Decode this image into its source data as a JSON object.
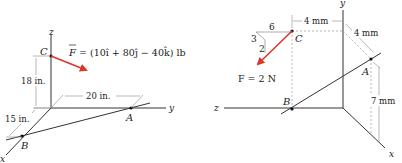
{
  "left_figure": {
    "axes": {
      "x": "x",
      "y": "y",
      "z": "z"
    },
    "points": {
      "A": "A",
      "B": "B",
      "C": "C"
    },
    "force_label_F": "F",
    "force_expression": "= (10î + 80ĵ − 40k̂) lb",
    "dimensions": {
      "height": "18 in.",
      "y_dist": "20 in.",
      "x_dist": "15 in."
    },
    "colors": {
      "force_arrow": "#d9382b",
      "lines": "#333333",
      "dashed": "#9a9a9a"
    }
  },
  "right_figure": {
    "axes": {
      "x": "x",
      "y": "y",
      "z": "z"
    },
    "points": {
      "A": "A",
      "B": "B",
      "C": "C"
    },
    "force_label": "F = 2 N",
    "slope_triangle": {
      "horizontal": "6",
      "hypotenuse": "3",
      "vertical": "2"
    },
    "dimensions": {
      "c_to_y": "4 mm",
      "x_offset": "4 mm",
      "a_height": "7 mm"
    },
    "colors": {
      "force_arrow": "#d9382b",
      "lines": "#333333",
      "dashed": "#9a9a9a"
    }
  }
}
